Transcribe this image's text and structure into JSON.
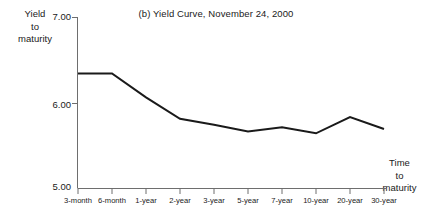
{
  "chart_data": {
    "type": "line",
    "title": "(b) Yield Curve, November 24, 2000",
    "xlabel": "Time to maturity",
    "ylabel": "Yield to maturity",
    "categories": [
      "3-month",
      "6-month",
      "1-year",
      "2-year",
      "3-year",
      "5-year",
      "7-year",
      "10-year",
      "20-year",
      "30-year"
    ],
    "values": [
      6.34,
      6.34,
      6.06,
      5.81,
      5.74,
      5.66,
      5.71,
      5.64,
      5.83,
      5.69
    ],
    "series": [
      {
        "name": "Yield curve",
        "values": [
          6.34,
          6.34,
          6.06,
          5.81,
          5.74,
          5.66,
          5.71,
          5.64,
          5.83,
          5.69
        ]
      }
    ],
    "ylim": [
      5.0,
      7.0
    ],
    "ytick_values": [
      7.0,
      6.0,
      5.0
    ],
    "ytick_labels": [
      "7.00",
      "6.00",
      "5.00"
    ],
    "grid": false,
    "legend": false,
    "legend_position": "none",
    "line_color": "#1a1a1a",
    "axis_color": "#6e6e6e"
  },
  "ylabel_lines": {
    "line1": "Yield",
    "line2": "to",
    "line3": "maturity"
  },
  "xlabel_lines": {
    "line1": "Time",
    "line2": "to",
    "line3": "maturity"
  }
}
